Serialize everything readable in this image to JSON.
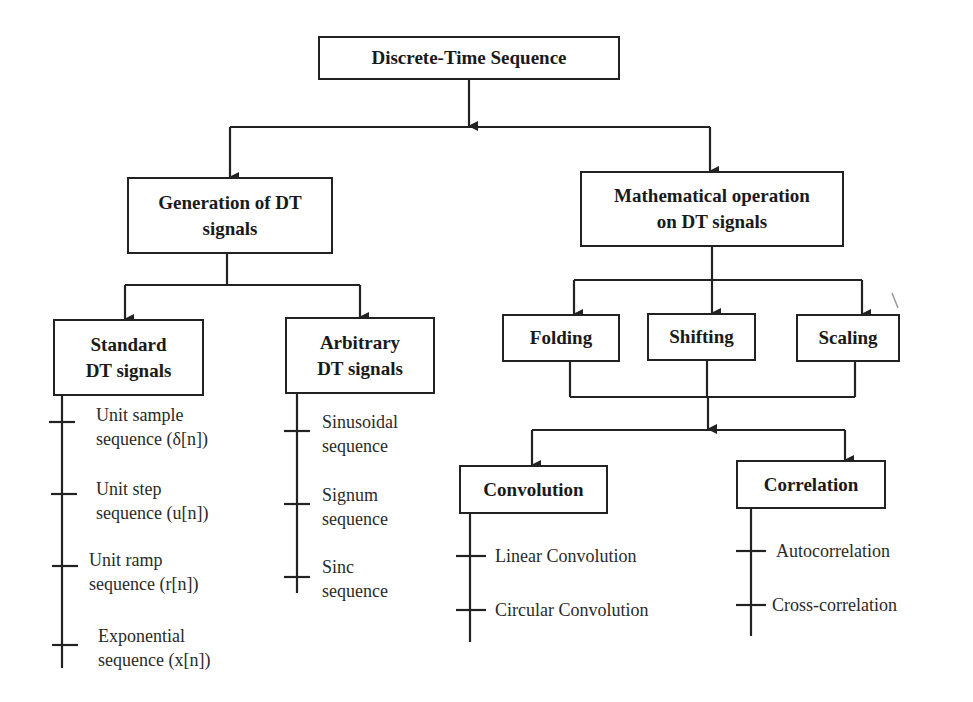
{
  "root": {
    "label": "Discrete-Time Sequence"
  },
  "generation": {
    "label_line1": "Generation of DT",
    "label_line2": "signals",
    "standard": {
      "label_line1": "Standard",
      "label_line2": "DT signals",
      "items": [
        {
          "line1": "Unit sample",
          "line2": "sequence (δ[n])"
        },
        {
          "line1": "Unit step",
          "line2": "sequence (u[n])"
        },
        {
          "line1": "Unit ramp",
          "line2": "sequence (r[n])"
        },
        {
          "line1": "Exponential",
          "line2": "sequence (x[n])"
        }
      ]
    },
    "arbitrary": {
      "label_line1": "Arbitrary",
      "label_line2": "DT signals",
      "items": [
        {
          "line1": "Sinusoidal",
          "line2": "sequence"
        },
        {
          "line1": "Signum",
          "line2": "sequence"
        },
        {
          "line1": "Sinc",
          "line2": "sequence"
        }
      ]
    }
  },
  "math_ops": {
    "label_line1": "Mathematical operation",
    "label_line2": "on DT signals",
    "operations": [
      {
        "label": "Folding"
      },
      {
        "label": "Shifting"
      },
      {
        "label": "Scaling"
      }
    ],
    "convolution": {
      "label": "Convolution",
      "items": [
        "Linear Convolution",
        "Circular Convolution"
      ]
    },
    "correlation": {
      "label": "Correlation",
      "items": [
        "Autocorrelation",
        "Cross-correlation"
      ]
    }
  }
}
